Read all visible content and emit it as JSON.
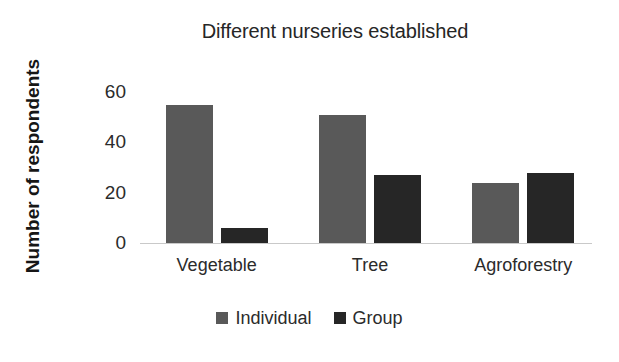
{
  "chart_data": {
    "type": "bar",
    "title": "Different nurseries established",
    "xlabel": "",
    "ylabel": "Number of respondents",
    "categories": [
      "Vegetable",
      "Tree",
      "Agroforestry"
    ],
    "series": [
      {
        "name": "Individual",
        "color": "#595959",
        "values": [
          55,
          51,
          24
        ]
      },
      {
        "name": "Group",
        "color": "#262626",
        "values": [
          6,
          27,
          28
        ]
      }
    ],
    "ylim": [
      0,
      60
    ],
    "yticks": [
      0,
      20,
      40,
      60
    ],
    "ytick_labels": [
      "0",
      "20",
      "40",
      "60"
    ],
    "grid": false,
    "legend_position": "bottom-center"
  },
  "legend": {
    "items": [
      {
        "label": "Individual",
        "color": "#595959"
      },
      {
        "label": "Group",
        "color": "#262626"
      }
    ]
  }
}
